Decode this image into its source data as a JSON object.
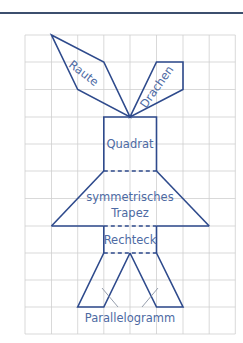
{
  "figure": {
    "grid": {
      "cols": 8,
      "rows": 11,
      "origin_x": 25,
      "origin_y": 35,
      "cell": 27.0
    },
    "colors": {
      "line": "#2e4a8c",
      "text": "#4d6aa3",
      "grid": "#c9c9c9",
      "pointer": "#8a93a3"
    },
    "labels": {
      "raute": "Raute",
      "drachen": "Drachen",
      "quadrat": "Quadrat",
      "trapez_line1": "symmetrisches",
      "trapez_line2": "Trapez",
      "rechteck": "Rechteck",
      "parallelogramm": "Parallelogramm"
    },
    "shapes": [
      {
        "name": "Raute",
        "points": [
          [
            1,
            0
          ],
          [
            3,
            1
          ],
          [
            4,
            3
          ],
          [
            2,
            2
          ]
        ]
      },
      {
        "name": "Drachen",
        "points": [
          [
            5,
            1
          ],
          [
            6,
            1
          ],
          [
            6,
            2
          ],
          [
            4,
            3
          ]
        ]
      },
      {
        "name": "Quadrat",
        "points": [
          [
            3,
            3
          ],
          [
            5,
            3
          ],
          [
            5,
            5
          ],
          [
            3,
            5
          ]
        ]
      },
      {
        "name": "symmetrisches Trapez",
        "points": [
          [
            3,
            5
          ],
          [
            5,
            5
          ],
          [
            7,
            7
          ],
          [
            1,
            7
          ]
        ]
      },
      {
        "name": "Rechteck",
        "points": [
          [
            3,
            7
          ],
          [
            5,
            7
          ],
          [
            5,
            8
          ],
          [
            3,
            8
          ]
        ]
      },
      {
        "name": "Parallelogramm links",
        "points": [
          [
            3,
            8
          ],
          [
            4,
            8
          ],
          [
            3,
            10
          ],
          [
            2,
            10
          ]
        ]
      },
      {
        "name": "Parallelogramm rechts",
        "points": [
          [
            4,
            8
          ],
          [
            5,
            8
          ],
          [
            6,
            10
          ],
          [
            5,
            10
          ]
        ]
      }
    ]
  }
}
